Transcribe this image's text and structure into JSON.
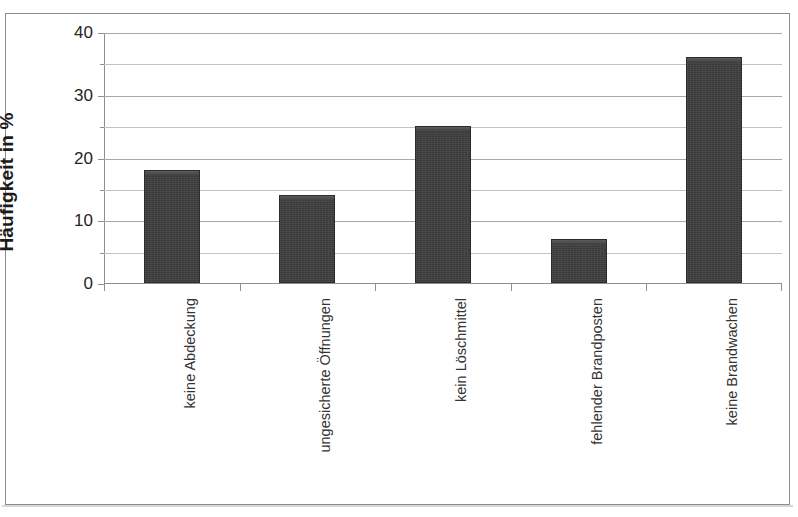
{
  "figure": {
    "background_color": "#ffffff",
    "frame_color": "#8d8d8d",
    "bar_color": "#3a3a3a",
    "gridline_color": "#a8a8a8"
  },
  "chart_data": {
    "type": "bar",
    "title": "",
    "xlabel": "",
    "ylabel": "Häufigkeit in %",
    "categories": [
      "keine Abdeckung",
      "ungesicherte Öffnungen",
      "kein Löschmittel",
      "fehlender Brandposten",
      "keine Brandwachen"
    ],
    "values": [
      18,
      14,
      25,
      7,
      36
    ],
    "ylim": [
      0,
      40
    ],
    "y_major_ticks": [
      0,
      10,
      20,
      30,
      40
    ],
    "y_minor_gridlines": [
      5,
      15,
      25,
      35
    ],
    "y_tick_labels": [
      "0",
      "10",
      "20",
      "30",
      "40"
    ],
    "grid": true,
    "legend": "none"
  }
}
